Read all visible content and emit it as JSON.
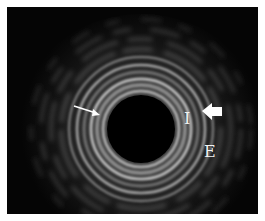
{
  "image": {
    "description": "Intravascular ultrasound cross-section showing concentric vessel wall layers around a dark central lumen",
    "labels": [
      {
        "id": "I",
        "text": "I"
      },
      {
        "id": "E",
        "text": "E"
      }
    ],
    "annotations": [
      {
        "type": "thin-arrow",
        "direction": "down-right",
        "target": "inner wall"
      },
      {
        "type": "thick-arrow",
        "direction": "left",
        "target": "outer ring"
      }
    ],
    "colors": {
      "background": "#050505",
      "lumen": "#000000",
      "ring_bright": "#d8d8d8",
      "ring_mid": "#8a8a8a",
      "border": "#ffffff"
    }
  }
}
